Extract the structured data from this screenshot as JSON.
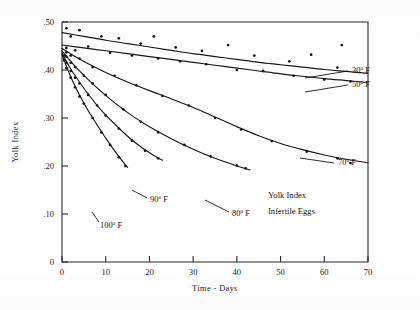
{
  "chart_data": {
    "type": "scatter",
    "title": "",
    "annotation_lines": [
      "Yolk Index",
      "Infertile Eggs"
    ],
    "xlabel": "Time - Days",
    "ylabel": "Yolk Index",
    "xlim": [
      0,
      70
    ],
    "ylim": [
      0,
      0.5
    ],
    "xticks": [
      0,
      10,
      20,
      30,
      40,
      50,
      60,
      70
    ],
    "xticklabels": [
      "0",
      "10",
      "20",
      "30",
      "40",
      "50",
      "60",
      "70"
    ],
    "yticks": [
      0,
      0.1,
      0.2,
      0.3,
      0.4,
      0.5
    ],
    "yticklabels": [
      "0",
      ".10",
      ".20",
      ".30",
      ".40",
      ".50"
    ],
    "grid": false,
    "legend_position": "inline-curve-labels",
    "series": [
      {
        "name": "30° F",
        "label": "30",
        "label_degree": "o",
        "label_unit": "F",
        "curve": [
          [
            0,
            0.478
          ],
          [
            5,
            0.47
          ],
          [
            10,
            0.462
          ],
          [
            15,
            0.455
          ],
          [
            20,
            0.448
          ],
          [
            25,
            0.441
          ],
          [
            30,
            0.434
          ],
          [
            35,
            0.428
          ],
          [
            40,
            0.422
          ],
          [
            45,
            0.416
          ],
          [
            50,
            0.411
          ],
          [
            55,
            0.406
          ],
          [
            60,
            0.401
          ],
          [
            65,
            0.397
          ],
          [
            70,
            0.393
          ]
        ],
        "points": [
          [
            1,
            0.487
          ],
          [
            2,
            0.47
          ],
          [
            4,
            0.483
          ],
          [
            9,
            0.47
          ],
          [
            13,
            0.466
          ],
          [
            18,
            0.455
          ],
          [
            21,
            0.47
          ],
          [
            26,
            0.447
          ],
          [
            32,
            0.44
          ],
          [
            38,
            0.452
          ],
          [
            44,
            0.43
          ],
          [
            52,
            0.418
          ],
          [
            57,
            0.432
          ],
          [
            63,
            0.405
          ],
          [
            64,
            0.452
          ]
        ]
      },
      {
        "name": "50° F",
        "label": "50",
        "label_degree": "o",
        "label_unit": "F",
        "curve": [
          [
            0,
            0.452
          ],
          [
            5,
            0.446
          ],
          [
            10,
            0.44
          ],
          [
            15,
            0.434
          ],
          [
            20,
            0.428
          ],
          [
            25,
            0.422
          ],
          [
            30,
            0.416
          ],
          [
            35,
            0.41
          ],
          [
            40,
            0.404
          ],
          [
            45,
            0.398
          ],
          [
            50,
            0.392
          ],
          [
            55,
            0.387
          ],
          [
            60,
            0.382
          ],
          [
            65,
            0.378
          ],
          [
            70,
            0.374
          ]
        ],
        "points": [
          [
            1,
            0.446
          ],
          [
            3,
            0.441
          ],
          [
            6,
            0.449
          ],
          [
            11,
            0.436
          ],
          [
            16,
            0.43
          ],
          [
            22,
            0.424
          ],
          [
            27,
            0.418
          ],
          [
            33,
            0.412
          ],
          [
            40,
            0.4
          ],
          [
            46,
            0.398
          ],
          [
            53,
            0.388
          ],
          [
            60,
            0.38
          ],
          [
            66,
            0.376
          ]
        ]
      },
      {
        "name": "70° F",
        "label": "70",
        "label_degree": "o",
        "label_unit": "F",
        "curve": [
          [
            0,
            0.445
          ],
          [
            3,
            0.428
          ],
          [
            6,
            0.413
          ],
          [
            10,
            0.395
          ],
          [
            15,
            0.375
          ],
          [
            20,
            0.357
          ],
          [
            25,
            0.34
          ],
          [
            30,
            0.322
          ],
          [
            35,
            0.302
          ],
          [
            40,
            0.282
          ],
          [
            45,
            0.263
          ],
          [
            50,
            0.247
          ],
          [
            55,
            0.234
          ],
          [
            60,
            0.223
          ],
          [
            65,
            0.214
          ],
          [
            70,
            0.207
          ]
        ],
        "points": [
          [
            1,
            0.437
          ],
          [
            2,
            0.43
          ],
          [
            4,
            0.424
          ],
          [
            7,
            0.406
          ],
          [
            12,
            0.388
          ],
          [
            17,
            0.368
          ],
          [
            23,
            0.346
          ],
          [
            29,
            0.326
          ],
          [
            35,
            0.3
          ],
          [
            41,
            0.276
          ],
          [
            48,
            0.252
          ],
          [
            56,
            0.23
          ],
          [
            63,
            0.216
          ],
          [
            66,
            0.206
          ]
        ]
      },
      {
        "name": "80° F",
        "label": "80",
        "label_degree": "o",
        "label_unit": "F",
        "curve": [
          [
            0,
            0.44
          ],
          [
            2,
            0.418
          ],
          [
            4,
            0.398
          ],
          [
            6,
            0.38
          ],
          [
            9,
            0.355
          ],
          [
            12,
            0.332
          ],
          [
            16,
            0.305
          ],
          [
            20,
            0.282
          ],
          [
            25,
            0.257
          ],
          [
            30,
            0.235
          ],
          [
            35,
            0.216
          ],
          [
            40,
            0.2
          ],
          [
            43,
            0.192
          ]
        ],
        "points": [
          [
            1,
            0.428
          ],
          [
            2,
            0.415
          ],
          [
            3,
            0.406
          ],
          [
            5,
            0.388
          ],
          [
            7,
            0.372
          ],
          [
            10,
            0.348
          ],
          [
            14,
            0.318
          ],
          [
            18,
            0.292
          ],
          [
            22,
            0.27
          ],
          [
            28,
            0.244
          ],
          [
            34,
            0.22
          ],
          [
            40,
            0.201
          ],
          [
            42,
            0.195
          ]
        ]
      },
      {
        "name": "90° F",
        "label": "90",
        "label_degree": "o",
        "label_unit": "F",
        "curve": [
          [
            0,
            0.436
          ],
          [
            1,
            0.418
          ],
          [
            2,
            0.402
          ],
          [
            3,
            0.388
          ],
          [
            5,
            0.362
          ],
          [
            7,
            0.338
          ],
          [
            9,
            0.316
          ],
          [
            12,
            0.288
          ],
          [
            15,
            0.262
          ],
          [
            18,
            0.24
          ],
          [
            21,
            0.222
          ],
          [
            23,
            0.212
          ]
        ],
        "points": [
          [
            0.5,
            0.43
          ],
          [
            1,
            0.415
          ],
          [
            2,
            0.398
          ],
          [
            3,
            0.384
          ],
          [
            4,
            0.372
          ],
          [
            6,
            0.348
          ],
          [
            8,
            0.326
          ],
          [
            10,
            0.305
          ],
          [
            13,
            0.278
          ],
          [
            16,
            0.253
          ],
          [
            19,
            0.232
          ],
          [
            22,
            0.216
          ]
        ]
      },
      {
        "name": "100° F",
        "label": "100",
        "label_degree": "o",
        "label_unit": "F",
        "curve": [
          [
            0,
            0.432
          ],
          [
            1,
            0.408
          ],
          [
            2,
            0.386
          ],
          [
            3,
            0.366
          ],
          [
            4,
            0.348
          ],
          [
            6,
            0.315
          ],
          [
            8,
            0.286
          ],
          [
            10,
            0.258
          ],
          [
            12,
            0.232
          ],
          [
            14,
            0.208
          ],
          [
            15,
            0.197
          ]
        ],
        "points": [
          [
            0.5,
            0.42
          ],
          [
            1,
            0.404
          ],
          [
            2,
            0.384
          ],
          [
            3,
            0.364
          ],
          [
            4,
            0.345
          ],
          [
            5,
            0.33
          ],
          [
            7,
            0.3
          ],
          [
            9,
            0.27
          ],
          [
            11,
            0.244
          ],
          [
            13,
            0.218
          ],
          [
            14.5,
            0.2
          ]
        ]
      }
    ]
  }
}
